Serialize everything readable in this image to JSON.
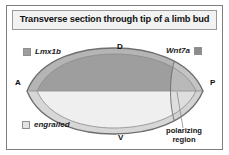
{
  "figure": {
    "title": "Transverse section through tip of a limb bud",
    "border_color": "#7e7e7e",
    "background": "#ffffff"
  },
  "axes": {
    "anterior": "A",
    "posterior": "P",
    "dorsal": "D",
    "ventral": "V"
  },
  "legend": [
    {
      "label": "Lmx1b",
      "swatch_color": "#9e9e9e",
      "position": "top-left"
    },
    {
      "label": "Wnt7a",
      "swatch_color": "#8c8c8c",
      "position": "top-right"
    },
    {
      "label": "engrailed",
      "swatch_color": "#e3e3e3",
      "position": "bottom-left"
    }
  ],
  "annotations": {
    "polarizing_region_line1": "polarizing",
    "polarizing_region_line2": "region"
  },
  "diagram": {
    "type": "cross-section-schematic",
    "outline_color": "#6f6f6f",
    "dorsal_fill": "#9e9e9e",
    "ventral_fill": "#eeeeee",
    "ectoderm_fill": "#c9c9c9",
    "polarizing_region_fill": "#d8d8d8"
  }
}
